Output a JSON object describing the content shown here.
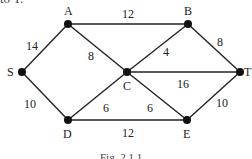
{
  "top_text": "to T.",
  "caption": "Fig. 2.1.1",
  "nodes": {
    "A": {
      "label": "A",
      "x": 68,
      "y": 24
    },
    "B": {
      "label": "B",
      "x": 188,
      "y": 24
    },
    "S": {
      "label": "S",
      "x": 22,
      "y": 72
    },
    "C": {
      "label": "C",
      "x": 127,
      "y": 72
    },
    "T": {
      "label": "T",
      "x": 240,
      "y": 72
    },
    "D": {
      "label": "D",
      "x": 68,
      "y": 120
    },
    "E": {
      "label": "E",
      "x": 187,
      "y": 120
    }
  },
  "edges": [
    {
      "from": "S",
      "to": "A",
      "weight": "14"
    },
    {
      "from": "A",
      "to": "B",
      "weight": "12"
    },
    {
      "from": "A",
      "to": "C",
      "weight": "8"
    },
    {
      "from": "B",
      "to": "C",
      "weight": "4"
    },
    {
      "from": "B",
      "to": "T",
      "weight": "8"
    },
    {
      "from": "C",
      "to": "T",
      "weight": "16"
    },
    {
      "from": "S",
      "to": "D",
      "weight": "10"
    },
    {
      "from": "D",
      "to": "C",
      "weight": "6"
    },
    {
      "from": "C",
      "to": "E",
      "weight": "6"
    },
    {
      "from": "D",
      "to": "E",
      "weight": "12"
    },
    {
      "from": "E",
      "to": "T",
      "weight": "10"
    }
  ]
}
